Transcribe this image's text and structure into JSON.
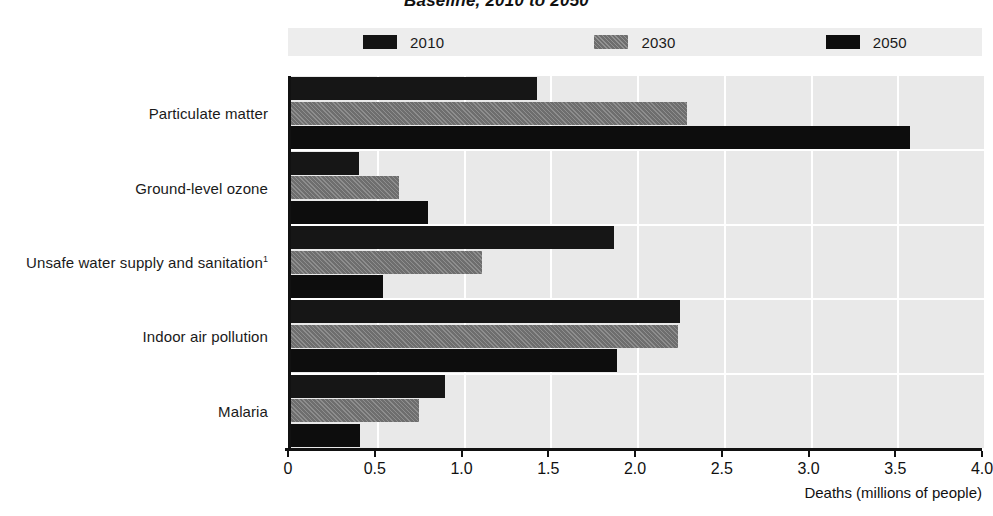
{
  "chart_data": {
    "type": "bar",
    "orientation": "horizontal",
    "title": "Baseline, 2010 to 2050",
    "xlabel": "Deaths (millions of people)",
    "ylabel": "",
    "xlim": [
      0,
      4.0
    ],
    "xticks": [
      "0",
      "0.5",
      "1.0",
      "1.5",
      "2.0",
      "2.5",
      "3.0",
      "3.5",
      "4.0"
    ],
    "xtick_values": [
      0,
      0.5,
      1.0,
      1.5,
      2.0,
      2.5,
      3.0,
      3.5,
      4.0
    ],
    "grid": true,
    "legend_position": "top",
    "categories": [
      "Particulate matter",
      "Ground-level ozone",
      "Unsafe water supply and sanitation",
      "Indoor air pollution",
      "Malaria"
    ],
    "category_superscripts": [
      "",
      "",
      "1",
      "",
      ""
    ],
    "series": [
      {
        "name": "2010",
        "color": "#161616",
        "values": [
          1.42,
          0.39,
          1.86,
          2.24,
          0.89
        ]
      },
      {
        "name": "2030",
        "color": "#6e6e6e",
        "values": [
          2.28,
          0.62,
          1.1,
          2.23,
          0.74
        ]
      },
      {
        "name": "2050",
        "color": "#0d0d0d",
        "values": [
          3.57,
          0.79,
          0.53,
          1.88,
          0.4
        ]
      }
    ]
  },
  "legend": {
    "entries": [
      {
        "label": "2010",
        "swatch": "sw-2010"
      },
      {
        "label": "2030",
        "swatch": "sw-2030"
      },
      {
        "label": "2050",
        "swatch": "sw-2050"
      }
    ]
  }
}
